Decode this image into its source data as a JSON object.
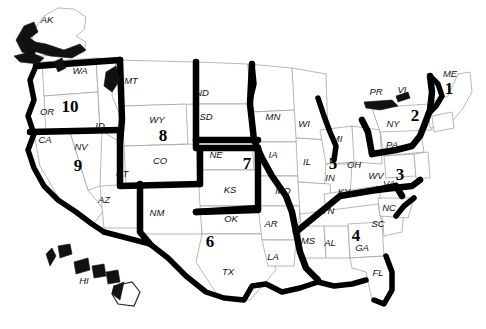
{
  "map": {
    "title": "United States Federal Regions Map",
    "background_color": "#ffffff",
    "border_color": "#000000",
    "state_outline_color": "#9a9a9a",
    "regions": [
      {
        "number": "1",
        "x": 449,
        "y": 90,
        "states": [
          "ME",
          "NH",
          "VT",
          "MA",
          "RI",
          "CT"
        ]
      },
      {
        "number": "2",
        "x": 415,
        "y": 117,
        "states": [
          "NY",
          "NJ",
          "PR",
          "VI"
        ]
      },
      {
        "number": "3",
        "x": 400,
        "y": 176,
        "states": [
          "PA",
          "WV",
          "VA",
          "MD",
          "DE",
          "DC"
        ]
      },
      {
        "number": "4",
        "x": 356,
        "y": 237,
        "states": [
          "KY",
          "TN",
          "NC",
          "SC",
          "MS",
          "AL",
          "GA",
          "FL"
        ]
      },
      {
        "number": "5",
        "x": 333,
        "y": 165,
        "states": [
          "MN",
          "WI",
          "MI",
          "IL",
          "IN",
          "OH"
        ]
      },
      {
        "number": "6",
        "x": 210,
        "y": 243,
        "states": [
          "NM",
          "TX",
          "OK",
          "AR",
          "LA"
        ]
      },
      {
        "number": "7",
        "x": 247,
        "y": 165,
        "states": [
          "NE",
          "IA",
          "KS",
          "MO"
        ]
      },
      {
        "number": "8",
        "x": 163,
        "y": 137,
        "states": [
          "MT",
          "ND",
          "SD",
          "WY",
          "CO",
          "UT"
        ]
      },
      {
        "number": "9",
        "x": 78,
        "y": 167,
        "states": [
          "CA",
          "NV",
          "AZ",
          "HI"
        ]
      },
      {
        "number": "10",
        "x": 70,
        "y": 108,
        "states": [
          "WA",
          "OR",
          "ID",
          "AK"
        ]
      }
    ],
    "state_labels": [
      {
        "abbr": "AK",
        "x": 47,
        "y": 20
      },
      {
        "abbr": "WA",
        "x": 80,
        "y": 71
      },
      {
        "abbr": "OR",
        "x": 47,
        "y": 112
      },
      {
        "abbr": "CA",
        "x": 45,
        "y": 140
      },
      {
        "abbr": "NV",
        "x": 81,
        "y": 147
      },
      {
        "abbr": "ID",
        "x": 100,
        "y": 126
      },
      {
        "abbr": "AZ",
        "x": 104,
        "y": 200
      },
      {
        "abbr": "UT",
        "x": 122,
        "y": 174
      },
      {
        "abbr": "MT",
        "x": 131,
        "y": 81
      },
      {
        "abbr": "WY",
        "x": 157,
        "y": 120
      },
      {
        "abbr": "CO",
        "x": 160,
        "y": 161
      },
      {
        "abbr": "NM",
        "x": 157,
        "y": 213
      },
      {
        "abbr": "ND",
        "x": 202,
        "y": 93
      },
      {
        "abbr": "SD",
        "x": 206,
        "y": 117
      },
      {
        "abbr": "NE",
        "x": 216,
        "y": 155
      },
      {
        "abbr": "KS",
        "x": 230,
        "y": 190
      },
      {
        "abbr": "OK",
        "x": 231,
        "y": 219
      },
      {
        "abbr": "TX",
        "x": 228,
        "y": 272
      },
      {
        "abbr": "MN",
        "x": 273,
        "y": 117
      },
      {
        "abbr": "IA",
        "x": 273,
        "y": 155
      },
      {
        "abbr": "MO",
        "x": 283,
        "y": 191
      },
      {
        "abbr": "AR",
        "x": 271,
        "y": 224
      },
      {
        "abbr": "LA",
        "x": 273,
        "y": 257
      },
      {
        "abbr": "WI",
        "x": 304,
        "y": 124
      },
      {
        "abbr": "IL",
        "x": 307,
        "y": 162
      },
      {
        "abbr": "IN",
        "x": 330,
        "y": 178
      },
      {
        "abbr": "MS",
        "x": 308,
        "y": 241
      },
      {
        "abbr": "AL",
        "x": 330,
        "y": 243
      },
      {
        "abbr": "MI",
        "x": 337,
        "y": 139
      },
      {
        "abbr": "OH",
        "x": 354,
        "y": 165
      },
      {
        "abbr": "KY",
        "x": 344,
        "y": 192
      },
      {
        "abbr": "TN",
        "x": 328,
        "y": 211
      },
      {
        "abbr": "GA",
        "x": 362,
        "y": 248
      },
      {
        "abbr": "FL",
        "x": 378,
        "y": 273
      },
      {
        "abbr": "SC",
        "x": 378,
        "y": 224
      },
      {
        "abbr": "NC",
        "x": 389,
        "y": 208
      },
      {
        "abbr": "WV",
        "x": 376,
        "y": 176
      },
      {
        "abbr": "VA",
        "x": 389,
        "y": 184
      },
      {
        "abbr": "PA",
        "x": 392,
        "y": 145
      },
      {
        "abbr": "NY",
        "x": 393,
        "y": 124
      },
      {
        "abbr": "ME",
        "x": 450,
        "y": 74
      },
      {
        "abbr": "PR",
        "x": 376,
        "y": 92
      },
      {
        "abbr": "VI",
        "x": 402,
        "y": 90
      },
      {
        "abbr": "HI",
        "x": 84,
        "y": 281
      }
    ]
  }
}
